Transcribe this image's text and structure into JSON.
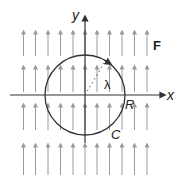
{
  "figure": {
    "labels": {
      "x_axis": "x",
      "y_axis": "y",
      "field": "F",
      "radius": "R",
      "curve": "C",
      "angle": "λ"
    },
    "colors": {
      "field_arrows": "#9a9a9a",
      "axes": "#333333",
      "circle": "#333333",
      "background": "#ffffff"
    },
    "field": {
      "direction": "up",
      "columns_x": [
        23.5,
        35.5,
        48,
        60.5,
        73,
        85,
        97,
        109.5,
        122,
        134.5,
        147
      ],
      "rows": [
        [
          29,
          56
        ],
        [
          64,
          92
        ],
        [
          102,
          130
        ],
        [
          142,
          175
        ]
      ]
    },
    "circle": {
      "cx": 85,
      "cy": 95,
      "r": 40,
      "orientation": "counterclockwise"
    }
  }
}
